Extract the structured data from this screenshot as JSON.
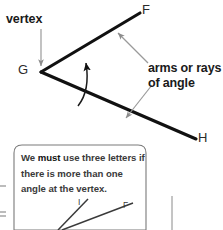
{
  "figure": {
    "title_alt": "Angle diagram with vertex, arms or rays, and naming rule callout",
    "colors": {
      "ray_stroke": "#111111",
      "arc_stroke": "#1a1a1a",
      "pointer_stroke": "#8c8c8c",
      "callout_border": "#7a7a7a",
      "text": "#1a1a1a",
      "callout_text": "#3a3a3a",
      "background": "#ffffff"
    }
  },
  "main_diagram": {
    "vertex_label": "vertex",
    "point_G": "G",
    "point_F": "F",
    "point_H": "H",
    "arms_label_line1": "arms or rays",
    "arms_label_line2": "of angle",
    "icons": {
      "vertex_pointer": "arrow-down-icon",
      "arm_pointer_upper": "arrow-up-left-icon",
      "arm_pointer_lower": "arrow-down-left-icon",
      "angle_arc": "angle-arc-arrow-icon"
    }
  },
  "callout": {
    "text_part1": "We ",
    "text_emph": "must",
    "text_part2": " use three letters if there is more than one angle at the vertex."
  },
  "lower_diagram": {
    "point_I": "I",
    "point_F": "F"
  }
}
